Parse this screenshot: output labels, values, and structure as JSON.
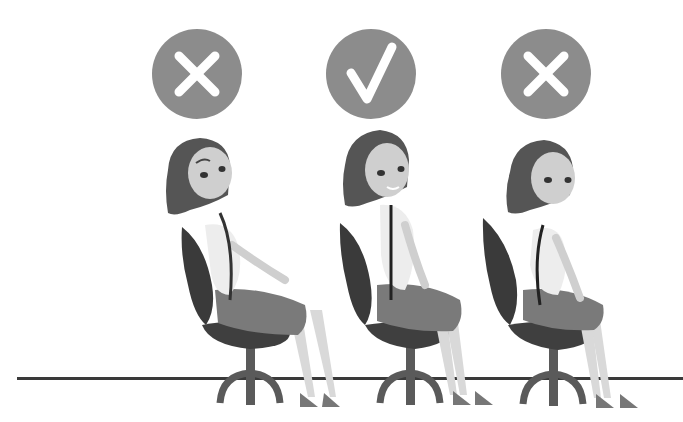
{
  "illustration": {
    "subject": "Sitting posture comparison",
    "background_color": "#ffffff",
    "floor_color": "#3a3a3a",
    "badge_color": "#8c8c8c",
    "mark_color": "#ffffff",
    "panels": [
      {
        "position": "left",
        "badge_icon": "cross-icon",
        "verdict": "incorrect",
        "posture": "reclined, slouching back"
      },
      {
        "position": "center",
        "badge_icon": "check-icon",
        "verdict": "correct",
        "posture": "upright, straight spine"
      },
      {
        "position": "right",
        "badge_icon": "cross-icon",
        "verdict": "incorrect",
        "posture": "hunched forward"
      }
    ]
  }
}
